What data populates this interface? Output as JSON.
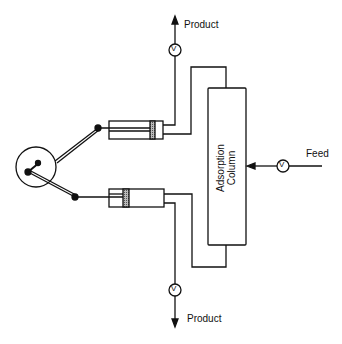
{
  "diagram": {
    "type": "process-flow",
    "title": "",
    "labels": {
      "product_top": "Product",
      "product_bottom": "Product",
      "feed": "Feed",
      "column_line1": "Adsorption",
      "column_line2": "Column",
      "valve_symbol": "V"
    },
    "components": [
      {
        "id": "crank-wheel",
        "kind": "rotating drive"
      },
      {
        "id": "piston-cylinder-top",
        "kind": "piston pump"
      },
      {
        "id": "piston-cylinder-bottom",
        "kind": "piston pump"
      },
      {
        "id": "adsorption-column",
        "kind": "column"
      },
      {
        "id": "valve-product-top",
        "kind": "valve"
      },
      {
        "id": "valve-product-bottom",
        "kind": "valve"
      },
      {
        "id": "valve-feed",
        "kind": "valve"
      }
    ],
    "colors": {
      "line": "#111111",
      "background": "#ffffff",
      "piston_fill": "#888888"
    }
  }
}
